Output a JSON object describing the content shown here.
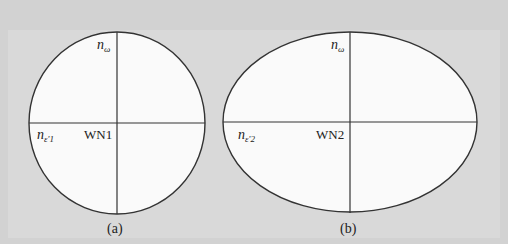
{
  "figure": {
    "panel_a": {
      "caption": "(a)",
      "vertical_axis_label": "n",
      "vertical_axis_subscript": "ω",
      "horizontal_axis_label": "n",
      "horizontal_axis_subscript": "ε'1",
      "center_label": "WN1",
      "shape": "circle"
    },
    "panel_b": {
      "caption": "(b)",
      "vertical_axis_label": "n",
      "vertical_axis_subscript": "ω",
      "horizontal_axis_label": "n",
      "horizontal_axis_subscript": "ε'2",
      "center_label": "WN2",
      "shape": "ellipse"
    }
  },
  "colors": {
    "background": "#d4d4d4",
    "shape_fill": "#fafafa",
    "line": "#333333"
  }
}
